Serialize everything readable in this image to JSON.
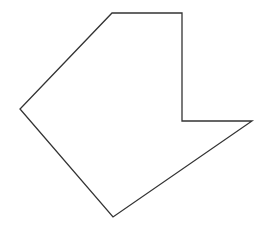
{
  "diagram": {
    "background": "#ffffff",
    "shape": {
      "type": "polygon",
      "stroke": "#333333",
      "stroke_width": 1.3,
      "fill": "none",
      "points": [
        [
          112,
          13
        ],
        [
          182,
          13
        ],
        [
          182,
          121
        ],
        [
          252,
          121
        ],
        [
          113,
          217
        ],
        [
          20,
          109
        ]
      ]
    }
  }
}
